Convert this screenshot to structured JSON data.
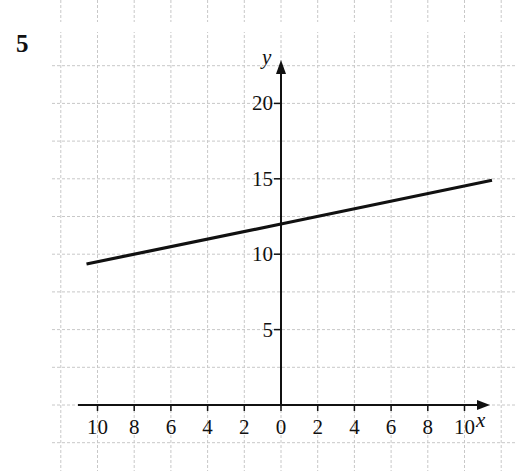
{
  "question": {
    "number": "5"
  },
  "chart_data": {
    "type": "line",
    "title": "",
    "xlabel": "x",
    "ylabel": "y",
    "x_tick_labels": [
      "10",
      "8",
      "6",
      "4",
      "2",
      "0",
      "2",
      "4",
      "6",
      "8",
      "10"
    ],
    "x_tick_values": [
      -10,
      -8,
      -6,
      -4,
      -2,
      0,
      2,
      4,
      6,
      8,
      10
    ],
    "y_tick_labels": [
      "5",
      "10",
      "15",
      "20"
    ],
    "y_tick_values": [
      5,
      10,
      15,
      20
    ],
    "xlim": [
      -12,
      12
    ],
    "ylim": [
      0,
      23
    ],
    "grid": true,
    "grid_x_step": 2,
    "grid_y_step": 2.5,
    "legend": null,
    "series": [
      {
        "name": "line",
        "equation": "y = 0.25x + 12",
        "x": [
          -10.6,
          0,
          11.5
        ],
        "y": [
          9.35,
          12,
          14.9
        ]
      }
    ]
  },
  "colors": {
    "grid": "#c8c8c8",
    "axis": "#111111",
    "line": "#111111",
    "background": "#ffffff"
  }
}
